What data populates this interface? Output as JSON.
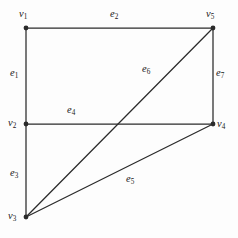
{
  "figure": {
    "background_color": "#fdfdfd",
    "stroke_color": "#2b2b2b",
    "text_color": "#1a1a1a",
    "width": 238,
    "height": 238
  },
  "vertices": [
    {
      "id": "v1",
      "name": "v",
      "index": "1",
      "x": 26,
      "y": 28,
      "label_x": 19,
      "label_y": 9,
      "dot": true
    },
    {
      "id": "v5",
      "name": "v",
      "index": "5",
      "x": 213,
      "y": 28,
      "label_x": 206,
      "label_y": 9,
      "dot": true
    },
    {
      "id": "v2",
      "name": "v",
      "index": "2",
      "x": 26,
      "y": 124,
      "label_x": 8,
      "label_y": 118,
      "dot": true
    },
    {
      "id": "v4",
      "name": "v",
      "index": "4",
      "x": 213,
      "y": 124,
      "label_x": 217,
      "label_y": 119,
      "dot": true
    },
    {
      "id": "v3",
      "name": "v",
      "index": "3",
      "x": 26,
      "y": 217,
      "label_x": 8,
      "label_y": 211,
      "dot": true
    }
  ],
  "edges": [
    {
      "id": "e1",
      "name": "e",
      "index": "1",
      "from": "v1",
      "to": "v2",
      "label_x": 10,
      "label_y": 68
    },
    {
      "id": "e2",
      "name": "e",
      "index": "2",
      "from": "v1",
      "to": "v5",
      "label_x": 110,
      "label_y": 9
    },
    {
      "id": "e3",
      "name": "e",
      "index": "3",
      "from": "v2",
      "to": "v3",
      "label_x": 10,
      "label_y": 168
    },
    {
      "id": "e4",
      "name": "e",
      "index": "4",
      "from": "v2",
      "to": "v4",
      "label_x": 67,
      "label_y": 105
    },
    {
      "id": "e5",
      "name": "e",
      "index": "5",
      "from": "v3",
      "to": "v4",
      "label_x": 126,
      "label_y": 174
    },
    {
      "id": "e6",
      "name": "e",
      "index": "6",
      "from": "v3",
      "to": "v5",
      "label_x": 142,
      "label_y": 64
    },
    {
      "id": "e7",
      "name": "e",
      "index": "7",
      "from": "v5",
      "to": "v4",
      "label_x": 216,
      "label_y": 68
    }
  ]
}
